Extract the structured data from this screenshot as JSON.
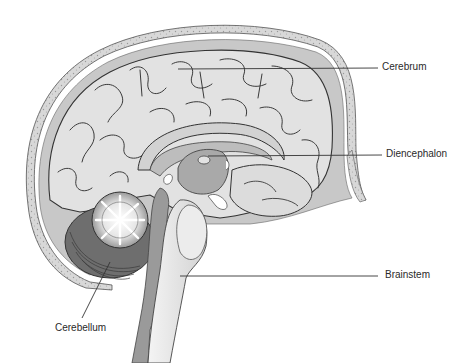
{
  "diagram": {
    "labels": [
      {
        "id": "cerebrum",
        "text": "Cerebrum"
      },
      {
        "id": "diencephalon",
        "text": "Diencephalon"
      },
      {
        "id": "brainstem",
        "text": "Brainstem"
      },
      {
        "id": "cerebellum",
        "text": "Cerebellum"
      }
    ],
    "colors": {
      "background": "#ffffff",
      "skull": "#d4d4d4",
      "meninges": "#bcbcbc",
      "cortex": "#e2e2e2",
      "sulcus_line": "#3a3a3a",
      "deep_structures": "#a9a9a9",
      "cerebellum_dark": "#6e6e6e",
      "brainstem": "#e9e9e9",
      "leader_line": "#333333",
      "label_text": "#2a2a2a"
    }
  }
}
